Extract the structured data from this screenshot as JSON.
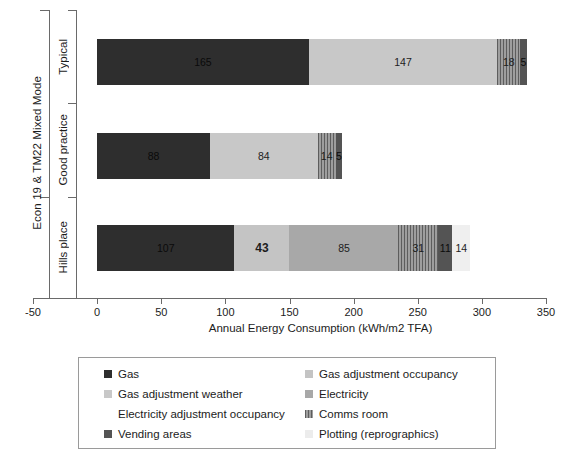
{
  "chart_data": {
    "type": "bar",
    "orientation": "horizontal",
    "stacked": true,
    "title": "",
    "xlabel": "Annual Energy Consumption (kWh/m2 TFA)",
    "ylabel": "",
    "xlim": [
      -50,
      350
    ],
    "xticks": [
      -50,
      0,
      50,
      100,
      150,
      200,
      250,
      300,
      350
    ],
    "grid": false,
    "legend_position": "bottom",
    "group_label": "Econ 19 & TM22 Mixed Mode",
    "group_members": [
      "Typical",
      "Good practice"
    ],
    "categories": [
      "Typical",
      "Good practice",
      "Hills place"
    ],
    "series": [
      {
        "name": "Gas",
        "color": "#2e2e2e",
        "pattern": "solid",
        "values": [
          165,
          88,
          107
        ]
      },
      {
        "name": "Gas adjustment occupancy",
        "color": "#b4b4b4",
        "pattern": "solid",
        "values": [
          0,
          0,
          43
        ]
      },
      {
        "name": "Gas adjustment weather",
        "color": "#c8c8c8",
        "pattern": "solid",
        "values": [
          147,
          84,
          0
        ]
      },
      {
        "name": "Electricity",
        "color": "#a8a8a8",
        "pattern": "solid",
        "values": [
          0,
          0,
          85
        ]
      },
      {
        "name": "Electricity adjustment occupancy",
        "color": "#ffffff",
        "pattern": "none",
        "values": [
          0,
          0,
          0
        ]
      },
      {
        "name": "Comms room",
        "color": "#9e9e9e",
        "pattern": "hatch",
        "values": [
          18,
          14,
          31
        ]
      },
      {
        "name": "Vending areas",
        "color": "#545454",
        "pattern": "solid",
        "values": [
          5,
          5,
          11
        ]
      },
      {
        "name": "Plotting (reprographics)",
        "color": "#ececec",
        "pattern": "solid",
        "values": [
          0,
          0,
          14
        ]
      }
    ],
    "bars": [
      {
        "category": "Typical",
        "total": 335,
        "segments": [
          {
            "series": "Gas",
            "value": 165,
            "label": "165",
            "color": "#2e2e2e",
            "pattern": "solid",
            "label_tone": "on-dark",
            "bold": false
          },
          {
            "series": "Gas adjustment weather",
            "value": 147,
            "label": "147",
            "color": "#c8c8c8",
            "pattern": "solid",
            "label_tone": "on-light",
            "bold": false
          },
          {
            "series": "Comms room",
            "value": 18,
            "label": "18",
            "color": "#9e9e9e",
            "pattern": "hatch",
            "label_tone": "on-light",
            "bold": false
          },
          {
            "series": "Vending areas",
            "value": 5,
            "label": "5",
            "color": "#545454",
            "pattern": "solid",
            "label_tone": "on-dark",
            "bold": false
          }
        ]
      },
      {
        "category": "Good practice",
        "total": 191,
        "segments": [
          {
            "series": "Gas",
            "value": 88,
            "label": "88",
            "color": "#2e2e2e",
            "pattern": "solid",
            "label_tone": "on-dark",
            "bold": false
          },
          {
            "series": "Gas adjustment weather",
            "value": 84,
            "label": "84",
            "color": "#c8c8c8",
            "pattern": "solid",
            "label_tone": "on-light",
            "bold": false
          },
          {
            "series": "Comms room",
            "value": 14,
            "label": "14",
            "color": "#9e9e9e",
            "pattern": "hatch",
            "label_tone": "on-light",
            "bold": false
          },
          {
            "series": "Vending areas",
            "value": 5,
            "label": "5",
            "color": "#545454",
            "pattern": "solid",
            "label_tone": "on-dark",
            "bold": false
          }
        ]
      },
      {
        "category": "Hills place",
        "total": 291,
        "segments": [
          {
            "series": "Gas",
            "value": 107,
            "label": "107",
            "color": "#2e2e2e",
            "pattern": "solid",
            "label_tone": "on-dark",
            "bold": false
          },
          {
            "series": "Gas adjustment occupancy",
            "value": 43,
            "label": "43",
            "color": "#c4c4c4",
            "pattern": "solid",
            "label_tone": "on-light",
            "bold": true
          },
          {
            "series": "Electricity",
            "value": 85,
            "label": "85",
            "color": "#a8a8a8",
            "pattern": "solid",
            "label_tone": "on-light",
            "bold": false
          },
          {
            "series": "Comms room",
            "value": 31,
            "label": "31",
            "color": "#9e9e9e",
            "pattern": "hatch",
            "label_tone": "on-light",
            "bold": false
          },
          {
            "series": "Vending areas",
            "value": 11,
            "label": "11",
            "color": "#545454",
            "pattern": "solid",
            "label_tone": "on-dark",
            "bold": false
          },
          {
            "series": "Plotting (reprographics)",
            "value": 14,
            "label": "14",
            "color": "#efefef",
            "pattern": "solid",
            "label_tone": "on-light",
            "bold": false
          }
        ]
      }
    ]
  },
  "axis": {
    "x_title": "Annual Energy Consumption (kWh/m2 TFA)",
    "x_tick_labels": [
      "-50",
      "0",
      "50",
      "100",
      "150",
      "200",
      "250",
      "300",
      "350"
    ],
    "group_label": "Econ 19 & TM22 Mixed Mode",
    "category_labels": [
      "Typical",
      "Good practice",
      "Hills place"
    ]
  },
  "legend": {
    "items": [
      {
        "label": "Gas",
        "color": "#2e2e2e",
        "pattern": "solid",
        "column": 1
      },
      {
        "label": "Gas adjustment occupancy",
        "color": "#c4c4c4",
        "pattern": "solid",
        "column": 2
      },
      {
        "label": "Gas adjustment weather",
        "color": "#c8c8c8",
        "pattern": "solid",
        "column": 1
      },
      {
        "label": "Electricity",
        "color": "#a8a8a8",
        "pattern": "solid",
        "column": 2
      },
      {
        "label": "Electricity adjustment occupancy",
        "color": "#ffffff",
        "pattern": "none",
        "column": 1
      },
      {
        "label": "Comms room",
        "color": "#9e9e9e",
        "pattern": "hatch",
        "column": 2
      },
      {
        "label": "Vending areas",
        "color": "#545454",
        "pattern": "solid",
        "column": 1
      },
      {
        "label": "Plotting (reprographics)",
        "color": "#ececec",
        "pattern": "solid",
        "column": 2
      }
    ]
  }
}
